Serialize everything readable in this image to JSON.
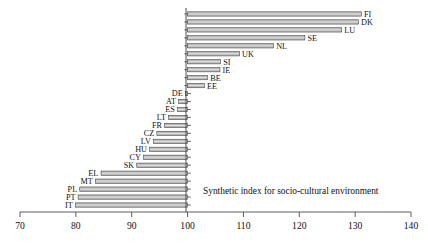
{
  "chart_data": {
    "type": "bar",
    "orientation": "horizontal",
    "title": "",
    "caption": "Synthetic index for socio-cultural environment",
    "xlabel": "",
    "ylabel": "",
    "baseline": 100,
    "xlim": [
      70,
      140
    ],
    "xticks": [
      70,
      80,
      90,
      100,
      110,
      120,
      130,
      140
    ],
    "xticklabels": [
      "70",
      "80",
      "90",
      "100",
      "110",
      "120",
      "130",
      "140"
    ],
    "grid": false,
    "legend": false,
    "categories": [
      "FI",
      "DK",
      "LU",
      "SE",
      "NL",
      "UK",
      "SI",
      "IE",
      "BE",
      "EE",
      "DE",
      "AT",
      "ES",
      "LT",
      "FR",
      "CZ",
      "LV",
      "HU",
      "CY",
      "SK",
      "EL",
      "MT",
      "PL",
      "PT",
      "IT"
    ],
    "values": [
      131.1,
      130.6,
      127.6,
      121.0,
      115.4,
      109.3,
      105.9,
      105.8,
      103.6,
      103.0,
      99.6,
      98.4,
      98.2,
      96.6,
      95.9,
      94.5,
      93.9,
      93.2,
      92.1,
      90.9,
      84.5,
      83.5,
      80.7,
      80.4,
      79.9
    ],
    "series": [
      {
        "name": "Synthetic index for socio-cultural environment",
        "values": [
          131.1,
          130.6,
          127.6,
          121.0,
          115.4,
          109.3,
          105.9,
          105.8,
          103.6,
          103.0,
          99.6,
          98.4,
          98.2,
          96.6,
          95.9,
          94.5,
          93.9,
          93.2,
          92.1,
          90.9,
          84.5,
          83.5,
          80.7,
          80.4,
          79.9
        ]
      }
    ]
  },
  "colors": {
    "bar_fill": "#b8b8b8",
    "bar_stroke": "#3c3c3c",
    "axis": "#4a4a4a",
    "text": "#111111",
    "background": "#ffffff"
  }
}
